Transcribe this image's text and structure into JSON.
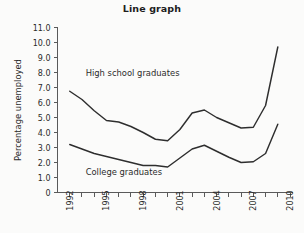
{
  "chart_data": {
    "type": "line",
    "title": "Line graph",
    "xlabel": "",
    "ylabel": "Percentage unemployed",
    "xlim": [
      1991,
      2010.2
    ],
    "ylim": [
      0,
      11
    ],
    "grid": false,
    "legend_position": "inline-annotation",
    "y_ticks": [
      "11.0",
      "10.0",
      "9.0",
      "8.0",
      "7.0",
      "6.0",
      "5.0",
      "4.0",
      "3.0",
      "2.0",
      "1.0",
      "0"
    ],
    "y_tick_values": [
      11,
      10,
      9,
      8,
      7,
      6,
      5,
      4,
      3,
      2,
      1,
      0
    ],
    "x_tick_values": [
      1992,
      1993,
      1994,
      1995,
      1996,
      1997,
      1998,
      1999,
      2000,
      2001,
      2002,
      2003,
      2004,
      2005,
      2006,
      2007,
      2008,
      2009,
      2010
    ],
    "x_tick_labels": [
      "1992",
      "",
      "",
      "1995",
      "",
      "",
      "1998",
      "",
      "",
      "2001",
      "",
      "",
      "2004",
      "",
      "",
      "2007",
      "",
      "",
      "2010"
    ],
    "x": [
      1992,
      1993,
      1994,
      1995,
      1996,
      1997,
      1998,
      1999,
      2000,
      2001,
      2002,
      2003,
      2004,
      2005,
      2006,
      2007,
      2008,
      2009
    ],
    "series": [
      {
        "name": "High school graduates",
        "label_x": 1993.3,
        "label_y": 7.75,
        "values": [
          6.75,
          6.2,
          5.45,
          4.8,
          4.7,
          4.4,
          4.0,
          3.55,
          3.45,
          4.2,
          5.3,
          5.5,
          5.0,
          4.65,
          4.3,
          4.35,
          5.8,
          9.7
        ]
      },
      {
        "name": "College graduates",
        "label_x": 1993.3,
        "label_y": 1.2,
        "values": [
          3.2,
          2.9,
          2.6,
          2.4,
          2.2,
          2.0,
          1.8,
          1.8,
          1.7,
          2.3,
          2.9,
          3.15,
          2.75,
          2.35,
          2.0,
          2.05,
          2.6,
          4.55
        ]
      }
    ]
  },
  "colors": {
    "line": "#2e2e2e",
    "axis": "#5a5a5a",
    "text": "#2b2b2b",
    "background": "#fbfbfa"
  }
}
